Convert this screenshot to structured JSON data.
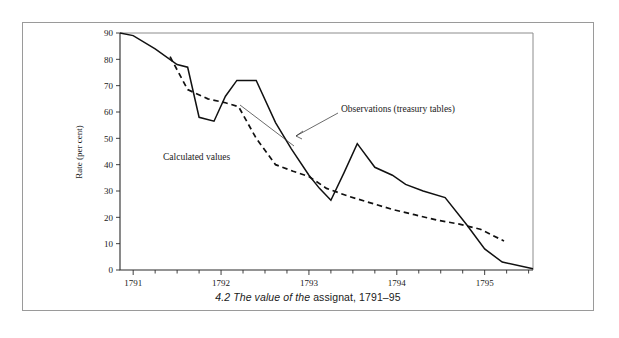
{
  "figure": {
    "caption_prefix": "4.2  The value of the ",
    "caption_term": "assignat",
    "caption_suffix": ", 1791–95",
    "caption_full": "4.2  The value of the assignat, 1791–95"
  },
  "annotations": {
    "observations_label": "Observations (treasury tables)",
    "calculated_label": "Calculated values"
  },
  "axes": {
    "y_title": "Rate (per cent)",
    "y_ticks": [
      "0",
      "10",
      "20",
      "30",
      "40",
      "50",
      "60",
      "70",
      "80",
      "90"
    ],
    "x_ticks": [
      "1791",
      "1792",
      "1793",
      "1794",
      "1795"
    ]
  },
  "chart_data": {
    "type": "line",
    "title": "4.2  The value of the assignat, 1791–95",
    "xlabel": "",
    "ylabel": "Rate (per cent)",
    "xlim": [
      1790.85,
      1795.55
    ],
    "ylim": [
      0,
      90
    ],
    "grid": false,
    "legend": "inline-annotations",
    "x_tick_values": [
      1791,
      1792,
      1793,
      1794,
      1795
    ],
    "x_tick_labels": [
      "1791",
      "1792",
      "1793",
      "1794",
      "1795"
    ],
    "x_minor_tick_step": 0.25,
    "y_tick_values": [
      0,
      10,
      20,
      30,
      40,
      50,
      60,
      70,
      80,
      90
    ],
    "y_tick_labels": [
      "0",
      "10",
      "20",
      "30",
      "40",
      "50",
      "60",
      "70",
      "80",
      "90"
    ],
    "series": [
      {
        "name": "Observations (treasury tables)",
        "style": "solid",
        "color": "#111111",
        "x": [
          1790.85,
          1791.0,
          1791.25,
          1791.5,
          1791.62,
          1791.75,
          1791.92,
          1792.05,
          1792.18,
          1792.4,
          1792.62,
          1792.8,
          1793.0,
          1793.12,
          1793.25,
          1793.4,
          1793.55,
          1793.75,
          1793.95,
          1794.1,
          1794.3,
          1794.55,
          1794.8,
          1795.0,
          1795.2,
          1795.55
        ],
        "y": [
          90.0,
          89.0,
          84.0,
          78.0,
          77.0,
          58.0,
          56.5,
          66.0,
          72.0,
          72.0,
          56.0,
          46.0,
          36.0,
          31.0,
          26.5,
          37.0,
          48.0,
          39.0,
          36.0,
          32.5,
          30.0,
          27.5,
          17.0,
          8.0,
          3.0,
          0.5
        ]
      },
      {
        "name": "Calculated values",
        "style": "dashed",
        "color": "#111111",
        "x": [
          1791.42,
          1791.62,
          1791.85,
          1792.05,
          1792.2,
          1792.4,
          1792.62,
          1792.82,
          1793.0,
          1793.2,
          1793.45,
          1793.7,
          1793.95,
          1794.2,
          1794.45,
          1794.7,
          1794.95,
          1795.22
        ],
        "y": [
          81.0,
          68.5,
          65.0,
          63.5,
          62.0,
          50.0,
          40.0,
          37.5,
          35.5,
          31.0,
          28.0,
          25.5,
          23.0,
          21.0,
          19.0,
          17.5,
          15.5,
          11.0
        ]
      }
    ]
  }
}
